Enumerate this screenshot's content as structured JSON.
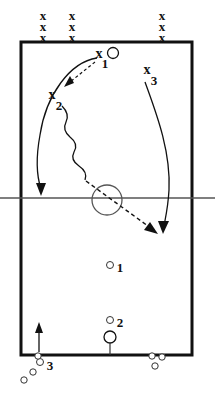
{
  "diagram": {
    "type": "volleyball-drill",
    "colors": {
      "ink": "#111111",
      "court_line": "#111111",
      "net_line": "#555555",
      "ball_fill": "#ffffff"
    },
    "court": {
      "x": 21,
      "y": 42,
      "width": 171,
      "height": 313,
      "net_y": 198,
      "net_extends_outside": true,
      "center_circle": {
        "cx": 107,
        "cy": 200,
        "r": 15
      }
    },
    "player_queues": [
      {
        "name": "queue-left",
        "x": 43,
        "glyph": "x",
        "count": 3,
        "marks": [
          "x",
          "x",
          "x"
        ]
      },
      {
        "name": "queue-middle",
        "x": 72,
        "glyph": "x",
        "count": 3,
        "marks": [
          "x",
          "x",
          "x"
        ]
      },
      {
        "name": "queue-right",
        "x": 162,
        "glyph": "x",
        "count": 3,
        "marks": [
          "x",
          "x",
          "x"
        ]
      }
    ],
    "players": [
      {
        "id": "x1",
        "glyph": "x",
        "index": "1",
        "x": 99,
        "y": 55,
        "label": "x1"
      },
      {
        "id": "x2",
        "glyph": "x",
        "index": "2",
        "x": 52,
        "y": 97,
        "label": "x2"
      },
      {
        "id": "x3",
        "glyph": "x",
        "index": "3",
        "x": 147,
        "y": 72,
        "label": "x3"
      }
    ],
    "target_markers": [
      {
        "id": "o1",
        "index": "1",
        "cx": 110,
        "cy": 265,
        "r": 3.5,
        "label": "1"
      },
      {
        "id": "o2",
        "index": "2",
        "cx": 110,
        "cy": 320,
        "r": 3.5,
        "label": "2"
      },
      {
        "id": "o3",
        "index": "3",
        "cx": 40,
        "cy": 362,
        "r": 3.5,
        "label": "3"
      }
    ],
    "ball_at_player": {
      "cx": 113,
      "cy": 53,
      "r": 5.5
    },
    "ball_cart": {
      "cx": 110,
      "cy": 337,
      "r": 6,
      "stem_to_y": 355
    },
    "ball_clusters": [
      {
        "name": "cluster-left",
        "balls": [
          {
            "cx": 38,
            "cy": 356,
            "r": 3.2
          },
          {
            "cx": 33,
            "cy": 364,
            "r": 3.2
          },
          {
            "cx": 31,
            "cy": 375,
            "r": 3.2
          },
          {
            "cx": 24,
            "cy": 382,
            "r": 3.2
          }
        ]
      },
      {
        "name": "cluster-right",
        "balls": [
          {
            "cx": 152,
            "cy": 356,
            "r": 3.2
          },
          {
            "cx": 162,
            "cy": 357,
            "r": 3.2
          },
          {
            "cx": 155,
            "cy": 366,
            "r": 3.2
          }
        ]
      }
    ],
    "movement_paths": [
      {
        "name": "x1-run-left-deep",
        "style": "solid",
        "arrow": true,
        "from": "x1",
        "to": "left-back-court"
      },
      {
        "name": "x1-to-x2-pass",
        "style": "dashed",
        "arrow": true,
        "from": "x1",
        "to": "x2"
      },
      {
        "name": "x2-attack-wavy",
        "style": "wavy-then-dashed",
        "arrow": true,
        "from": "x2",
        "to": "opponent-court-right"
      },
      {
        "name": "x3-run-down",
        "style": "solid",
        "arrow": true,
        "from": "x3",
        "to": "opponent-court-right"
      },
      {
        "name": "o3-enter-court",
        "style": "solid",
        "arrow": true,
        "from": "below-court",
        "to": "court-bottom-left"
      }
    ],
    "legend": {
      "solid_line": "player movement",
      "dashed_line": "ball flight",
      "wavy_line": "attack"
    }
  }
}
